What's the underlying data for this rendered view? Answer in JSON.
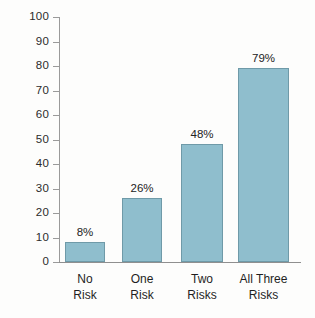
{
  "chart_data": {
    "type": "bar",
    "title": "",
    "subtitle": "",
    "xlabel": "",
    "ylabel": "",
    "categories": [
      "No Risk",
      "One Risk",
      "Two Risks",
      "All Three Risks"
    ],
    "category_lines": [
      [
        "No",
        "Risk"
      ],
      [
        "One",
        "Risk"
      ],
      [
        "Two",
        "Risks"
      ],
      [
        "All Three",
        "Risks"
      ]
    ],
    "values": [
      8,
      26,
      48,
      79
    ],
    "data_labels": [
      "8%",
      "26%",
      "48%",
      "79%"
    ],
    "ylim": [
      0,
      100
    ],
    "ytick_step": 10,
    "ytick_labels": [
      "0",
      "10",
      "20",
      "30",
      "40",
      "50",
      "60",
      "70",
      "80",
      "90",
      "100"
    ],
    "ytick_values": [
      0,
      10,
      20,
      30,
      40,
      50,
      60,
      70,
      80,
      90,
      100
    ],
    "grid": false,
    "legend": null,
    "legend_position": "none",
    "bar_color": "#8fbecd",
    "bar_border_color": "#6f9aa8",
    "axis_color": "#9a9a9a",
    "text_color": "#232323",
    "background_color": "#fdfdfc"
  }
}
